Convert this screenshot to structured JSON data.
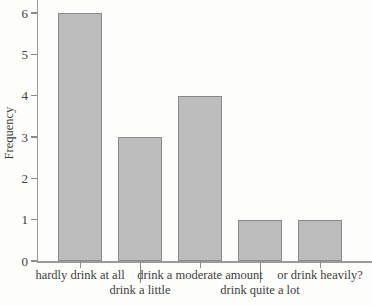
{
  "chart_data": {
    "type": "bar",
    "title": "",
    "categories": [
      "hardly drink at all",
      "drink a little",
      "drink a moderate amount",
      "drink quite a lot",
      "or drink heavily?"
    ],
    "values": [
      6,
      3,
      4,
      1,
      1
    ],
    "label_row": [
      1,
      2,
      1,
      2,
      1
    ],
    "xlabel": "",
    "ylabel": "Frequency",
    "yticks": [
      0,
      1,
      2,
      3,
      4,
      5,
      6
    ],
    "ylim": [
      0,
      6.3
    ],
    "grid": false,
    "legend": "none",
    "colors": {
      "bar_fill": "#bdbdbd",
      "bar_border": "#8a8a8a",
      "axis": "#9a9a9a",
      "tick": "#8c8c8c",
      "text": "#3d3d3d",
      "background": "#fdfdfb"
    }
  }
}
